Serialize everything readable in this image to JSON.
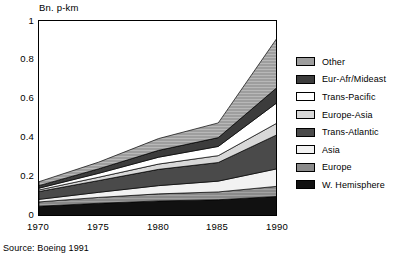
{
  "chart_data": {
    "type": "area",
    "title": "",
    "ylabel": "Bn. p-km",
    "xlabel": "",
    "ylim": [
      0,
      1
    ],
    "xlim": [
      1970,
      1990
    ],
    "yticks": [
      "0",
      "0.2",
      "0.4",
      "0.6",
      "0.8",
      "1"
    ],
    "ytick_values": [
      0,
      0.2,
      0.4,
      0.6,
      0.8,
      1
    ],
    "categories": [
      "1970",
      "1975",
      "1980",
      "1985",
      "1990"
    ],
    "x": [
      1970,
      1975,
      1980,
      1985,
      1990
    ],
    "grid": false,
    "stacked": true,
    "legend_position": "right",
    "source": "Source: Boeing 1991",
    "series": [
      {
        "name": "W. Hemisphere",
        "color": "#111111",
        "values": [
          0.055,
          0.07,
          0.082,
          0.088,
          0.105
        ]
      },
      {
        "name": "Europe",
        "color": "#8a8a8a",
        "values": [
          0.022,
          0.03,
          0.036,
          0.04,
          0.052
        ]
      },
      {
        "name": "Asia",
        "color": "#f2f2f2",
        "values": [
          0.013,
          0.026,
          0.042,
          0.055,
          0.09
        ]
      },
      {
        "name": "Trans-Atlantic",
        "color": "#4a4a4a",
        "values": [
          0.04,
          0.06,
          0.083,
          0.095,
          0.175
        ]
      },
      {
        "name": "Europe-Asia",
        "color": "#d8d8d8",
        "values": [
          0.008,
          0.017,
          0.027,
          0.035,
          0.06
        ]
      },
      {
        "name": "Trans-Pacific",
        "color": "#ffffff",
        "values": [
          0.009,
          0.02,
          0.035,
          0.047,
          0.105
        ]
      },
      {
        "name": "Eur-Afr/Mideast",
        "color": "#3c3c3c",
        "values": [
          0.013,
          0.023,
          0.035,
          0.045,
          0.078
        ]
      },
      {
        "name": "Other",
        "color": "#9e9e9e",
        "values": [
          0.02,
          0.034,
          0.06,
          0.075,
          0.255
        ]
      }
    ],
    "totals": [
      0.18,
      0.28,
      0.4,
      0.48,
      0.92
    ]
  },
  "axis": {
    "y_title": "Bn. p-km",
    "yticks": [
      {
        "label": "1"
      },
      {
        "label": "0.8"
      },
      {
        "label": "0.6"
      },
      {
        "label": "0.4"
      },
      {
        "label": "0.2"
      },
      {
        "label": "0"
      }
    ],
    "xticks": [
      {
        "label": "1970"
      },
      {
        "label": "1975"
      },
      {
        "label": "1980"
      },
      {
        "label": "1985"
      },
      {
        "label": "1990"
      }
    ]
  },
  "legend": {
    "items": [
      {
        "label": "Other",
        "color": "#9e9e9e"
      },
      {
        "label": "Eur-Afr/Mideast",
        "color": "#3c3c3c"
      },
      {
        "label": "Trans-Pacific",
        "color": "#ffffff"
      },
      {
        "label": "Europe-Asia",
        "color": "#d8d8d8"
      },
      {
        "label": "Trans-Atlantic",
        "color": "#4a4a4a"
      },
      {
        "label": "Asia",
        "color": "#f2f2f2"
      },
      {
        "label": "Europe",
        "color": "#8a8a8a"
      },
      {
        "label": "W. Hemisphere",
        "color": "#111111"
      }
    ]
  },
  "footer": {
    "source": "Source: Boeing 1991"
  }
}
